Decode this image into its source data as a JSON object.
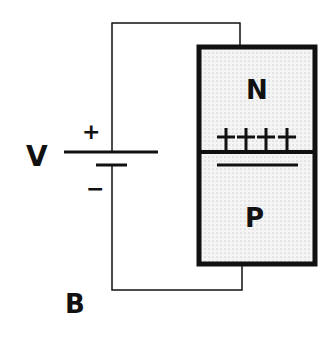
{
  "labels": {
    "voltage": "V",
    "node": "B",
    "positive_terminal": "+",
    "negative_terminal": "−",
    "n_region": "N",
    "p_region": "P"
  },
  "junction": {
    "positive_charges": "++++",
    "negative_charges": "————"
  },
  "colors": {
    "line": "#111111",
    "fill": "#eeeeee"
  }
}
